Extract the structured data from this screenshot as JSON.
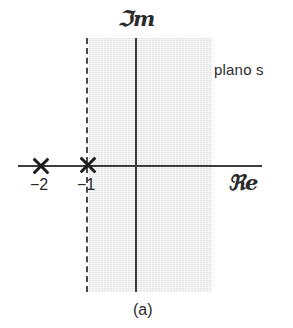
{
  "figure": {
    "caption": "(a)",
    "plane_label": "plano s",
    "axes": {
      "imaginary_label": "ℑm",
      "real_label": "ℜe"
    },
    "poles": [
      {
        "label": "−2",
        "marker": "x-marker",
        "real": -2,
        "imag": 0
      },
      {
        "label": "−1",
        "marker": "x-marker",
        "real": -1,
        "imag": 0
      }
    ],
    "region": {
      "name": "shaded-half-plane",
      "boundary_style": "dashed",
      "boundary_real": -1,
      "fill_color": "#ebebeb",
      "description": "Re(s) > -1"
    },
    "colors": {
      "axis": "#3d3d3d",
      "marker": "#1a1a1a",
      "boundary": "#4a4a4a",
      "text": "#2b2b2b",
      "background": "#ffffff"
    }
  },
  "chart_data": {
    "type": "scatter",
    "title": "plano s",
    "xlabel": "ℜe",
    "ylabel": "ℑm",
    "xlim": [
      -2.9,
      2.7
    ],
    "ylim": [
      -2.9,
      2.9
    ],
    "grid": false,
    "legend": null,
    "series": [
      {
        "name": "poles",
        "marker": "x",
        "x": [
          -2,
          -1
        ],
        "y": [
          0,
          0
        ],
        "point_labels": [
          "−2",
          "−1"
        ]
      }
    ],
    "annotations": [
      {
        "text": "plano s",
        "x": 1.6,
        "y": 2.2
      },
      {
        "text": "(a)",
        "x": 0.0,
        "y": -3.4
      }
    ],
    "shaded_regions": [
      {
        "name": "region-of-convergence",
        "x_from": -1,
        "x_to": 1.7,
        "y_from": -2.9,
        "y_to": 2.9,
        "color": "#ebebeb",
        "left_edge": "dashed"
      }
    ]
  }
}
